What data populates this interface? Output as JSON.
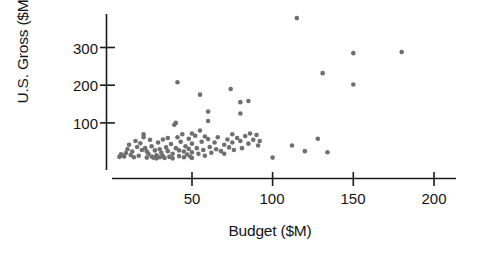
{
  "chart_data": {
    "type": "scatter",
    "title": "",
    "xlabel": "Budget ($M)",
    "ylabel": "U.S. Gross ($M)",
    "xlim": [
      0,
      210
    ],
    "ylim": [
      0,
      400
    ],
    "xticks": [
      50,
      100,
      150,
      200
    ],
    "xtick_labels": [
      "50",
      "100",
      "150",
      "200"
    ],
    "yticks": [
      100,
      200,
      300
    ],
    "ytick_labels": [
      "100",
      "200",
      "300"
    ],
    "grid": false,
    "legend": null,
    "marker_color": "#6f6f6f",
    "axis_color": "#1b1b1b",
    "background": "#ffffff",
    "series": [
      {
        "name": "Movies",
        "points": [
          [
            5,
            10
          ],
          [
            6,
            17
          ],
          [
            7,
            13
          ],
          [
            8,
            11
          ],
          [
            9,
            20
          ],
          [
            10,
            30
          ],
          [
            11,
            42
          ],
          [
            12,
            15
          ],
          [
            13,
            24
          ],
          [
            14,
            9
          ],
          [
            15,
            52
          ],
          [
            16,
            36
          ],
          [
            17,
            13
          ],
          [
            18,
            46
          ],
          [
            19,
            28
          ],
          [
            20,
            70
          ],
          [
            20,
            62
          ],
          [
            21,
            33
          ],
          [
            22,
            24
          ],
          [
            22,
            8
          ],
          [
            23,
            18
          ],
          [
            24,
            55
          ],
          [
            25,
            38
          ],
          [
            25,
            11
          ],
          [
            26,
            8
          ],
          [
            27,
            27
          ],
          [
            28,
            14
          ],
          [
            28,
            6
          ],
          [
            29,
            48
          ],
          [
            30,
            30
          ],
          [
            30,
            9
          ],
          [
            31,
            21
          ],
          [
            32,
            56
          ],
          [
            32,
            12
          ],
          [
            33,
            7
          ],
          [
            34,
            35
          ],
          [
            35,
            60
          ],
          [
            35,
            25
          ],
          [
            36,
            10
          ],
          [
            37,
            44
          ],
          [
            38,
            18
          ],
          [
            38,
            6
          ],
          [
            39,
            95
          ],
          [
            40,
            100
          ],
          [
            40,
            33
          ],
          [
            41,
            62
          ],
          [
            42,
            27
          ],
          [
            42,
            12
          ],
          [
            43,
            50
          ],
          [
            44,
            70
          ],
          [
            45,
            24
          ],
          [
            45,
            9
          ],
          [
            46,
            38
          ],
          [
            47,
            16
          ],
          [
            48,
            58
          ],
          [
            48,
            31
          ],
          [
            49,
            11
          ],
          [
            50,
            72
          ],
          [
            50,
            45
          ],
          [
            50,
            22
          ],
          [
            50,
            7
          ],
          [
            41,
            208
          ],
          [
            52,
            66
          ],
          [
            53,
            33
          ],
          [
            54,
            18
          ],
          [
            55,
            80
          ],
          [
            55,
            175
          ],
          [
            56,
            50
          ],
          [
            57,
            28
          ],
          [
            58,
            64
          ],
          [
            58,
            13
          ],
          [
            60,
            130
          ],
          [
            60,
            105
          ],
          [
            60,
            57
          ],
          [
            61,
            36
          ],
          [
            62,
            21
          ],
          [
            64,
            48
          ],
          [
            65,
            30
          ],
          [
            66,
            62
          ],
          [
            68,
            25
          ],
          [
            70,
            42
          ],
          [
            70,
            18
          ],
          [
            72,
            56
          ],
          [
            73,
            35
          ],
          [
            74,
            190
          ],
          [
            75,
            70
          ],
          [
            75,
            48
          ],
          [
            76,
            28
          ],
          [
            78,
            60
          ],
          [
            80,
            155
          ],
          [
            80,
            125
          ],
          [
            80,
            52
          ],
          [
            81,
            33
          ],
          [
            83,
            65
          ],
          [
            85,
            158
          ],
          [
            85,
            45
          ],
          [
            86,
            72
          ],
          [
            88,
            55
          ],
          [
            90,
            68
          ],
          [
            91,
            40
          ],
          [
            92,
            52
          ],
          [
            100,
            8
          ],
          [
            112,
            40
          ],
          [
            115,
            378
          ],
          [
            120,
            25
          ],
          [
            128,
            58
          ],
          [
            131,
            232
          ],
          [
            134,
            22
          ],
          [
            150,
            285
          ],
          [
            150,
            202
          ],
          [
            180,
            288
          ]
        ]
      }
    ]
  },
  "axes": {
    "ylabel": "U.S. Gross ($M)",
    "xlabel": "Budget ($M)",
    "ytick_labels": [
      "300",
      "200",
      "100"
    ],
    "xtick_labels": [
      "50",
      "100",
      "150",
      "200"
    ]
  }
}
